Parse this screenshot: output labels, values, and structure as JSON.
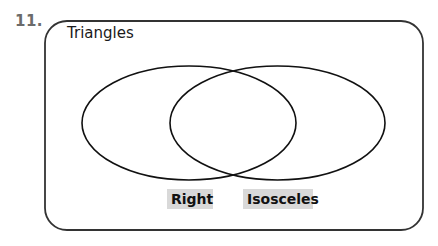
{
  "problem": {
    "number": "11."
  },
  "venn": {
    "universe_label": "Triangles",
    "sets": [
      {
        "label": "Right"
      },
      {
        "label": "Isosceles"
      }
    ],
    "colors": {
      "stroke": "#1a1a1a",
      "label_background": "#d9d9d9",
      "number_color": "#6b6b6b"
    }
  }
}
